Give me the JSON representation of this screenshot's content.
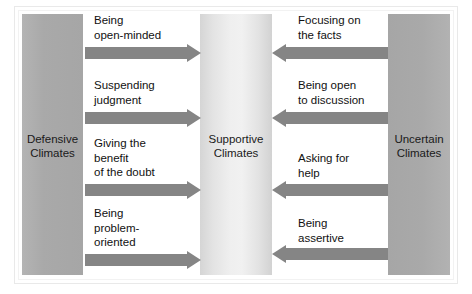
{
  "figure": {
    "columns": [
      {
        "id": "defensive",
        "label": "Defensive\nClimates",
        "color": "#a9a9a9"
      },
      {
        "id": "supportive",
        "label": "Supportive\nClimates",
        "color": "#ececec"
      },
      {
        "id": "uncertain",
        "label": "Uncertain\nClimates",
        "color": "#a9a9a9"
      }
    ],
    "arrow_color": "#858585",
    "left_flows": [
      {
        "caption": "Being\nopen-minded",
        "direction": "right"
      },
      {
        "caption": "Suspending\njudgment",
        "direction": "right"
      },
      {
        "caption": "Giving the\nbenefit\nof the doubt",
        "direction": "right"
      },
      {
        "caption": "Being\nproblem-\noriented",
        "direction": "right"
      }
    ],
    "right_flows": [
      {
        "caption": "Focusing on\nthe facts",
        "direction": "left"
      },
      {
        "caption": "Being open\nto discussion",
        "direction": "left"
      },
      {
        "caption": "Asking for\nhelp",
        "direction": "left"
      },
      {
        "caption": "Being\nassertive",
        "direction": "left"
      }
    ]
  }
}
